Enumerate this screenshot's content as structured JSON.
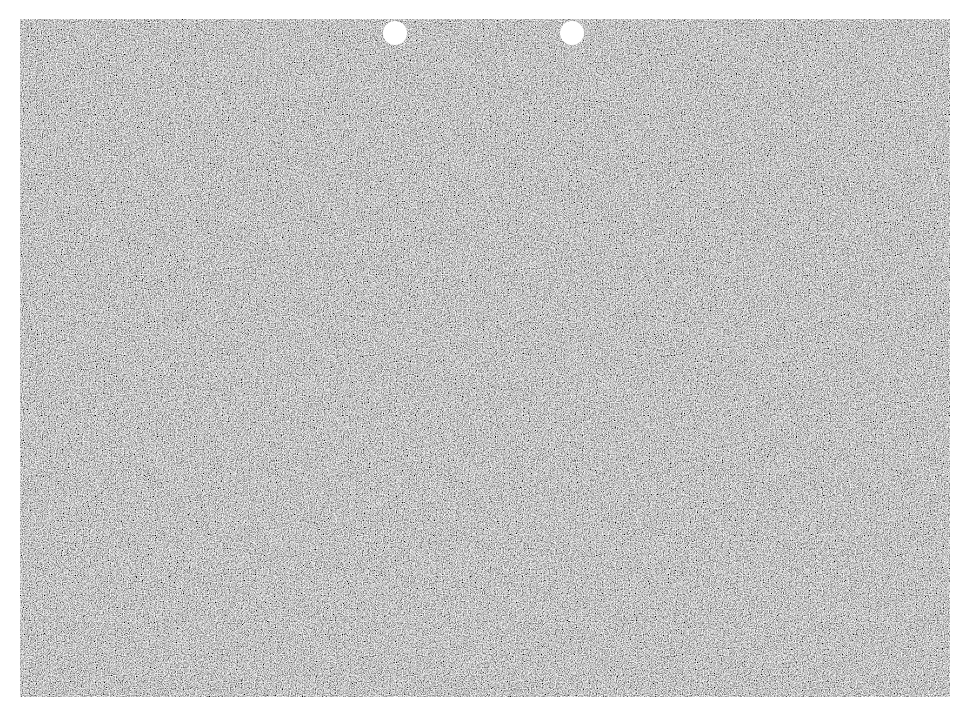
{
  "sheet": {
    "texture": "grayscale-noise",
    "base_color": "#8a8a8a",
    "light_color": "#d8d8d8",
    "dark_color": "#3a3a3a",
    "background_color": "#ffffff"
  },
  "holes": [
    {
      "name": "punch-hole-left",
      "cx": 395,
      "cy": 33,
      "r": 12
    },
    {
      "name": "punch-hole-right",
      "cx": 572,
      "cy": 33,
      "r": 12
    }
  ]
}
